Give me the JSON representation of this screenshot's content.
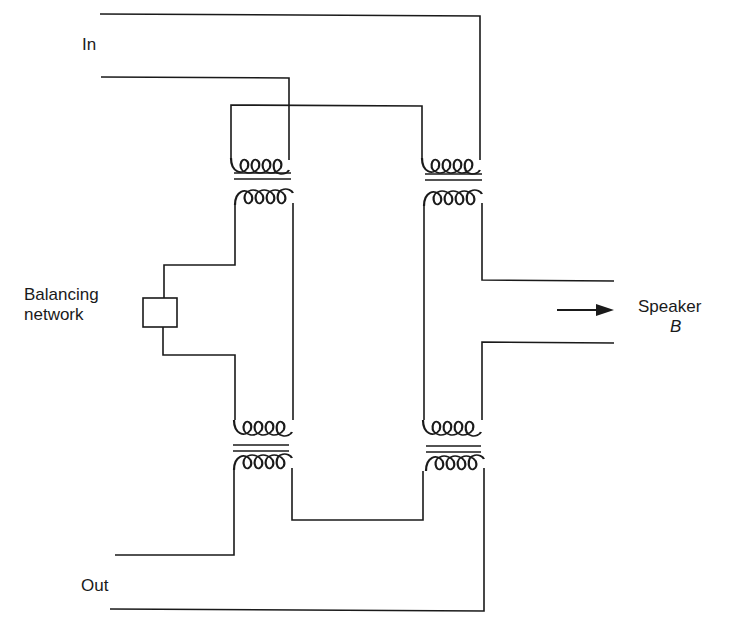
{
  "labels": {
    "in": "In",
    "out": "Out",
    "balancing_line1": "Balancing",
    "balancing_line2": "network",
    "speaker_line1": "Speaker",
    "speaker_line2": "B"
  },
  "colors": {
    "line": "#1a1a1a",
    "background": "#ffffff"
  },
  "components": [
    {
      "type": "transformer",
      "id": "T1-top-left"
    },
    {
      "type": "transformer",
      "id": "T2-top-right"
    },
    {
      "type": "transformer",
      "id": "T3-bottom-left"
    },
    {
      "type": "transformer",
      "id": "T4-bottom-right"
    },
    {
      "type": "box",
      "id": "balancing-network"
    },
    {
      "type": "arrow",
      "id": "speaker-arrow",
      "direction": "right"
    }
  ]
}
